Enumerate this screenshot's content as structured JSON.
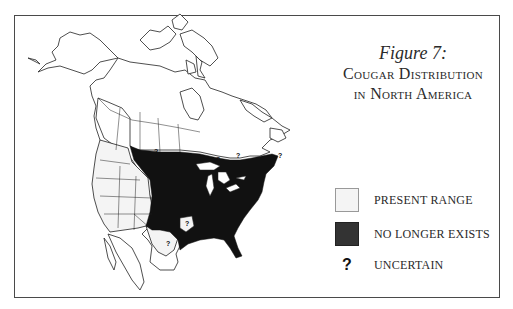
{
  "figure": {
    "number_label": "Figure 7:",
    "title_line1": "Cougar Distribution",
    "title_line2": "in North America"
  },
  "legend": {
    "items": [
      {
        "label": "PRESENT RANGE",
        "symbol": "light-swatch",
        "color": "#f4f4f4"
      },
      {
        "label": "NO LONGER EXISTS",
        "symbol": "dark-swatch",
        "color": "#333333"
      },
      {
        "label": "UNCERTAIN",
        "symbol": "?"
      }
    ]
  },
  "map": {
    "region": "North America",
    "uncertain_marker": "?",
    "colors": {
      "present_range": "#f4f4f4",
      "no_longer_exists": "#111111",
      "outline": "#222222"
    }
  }
}
